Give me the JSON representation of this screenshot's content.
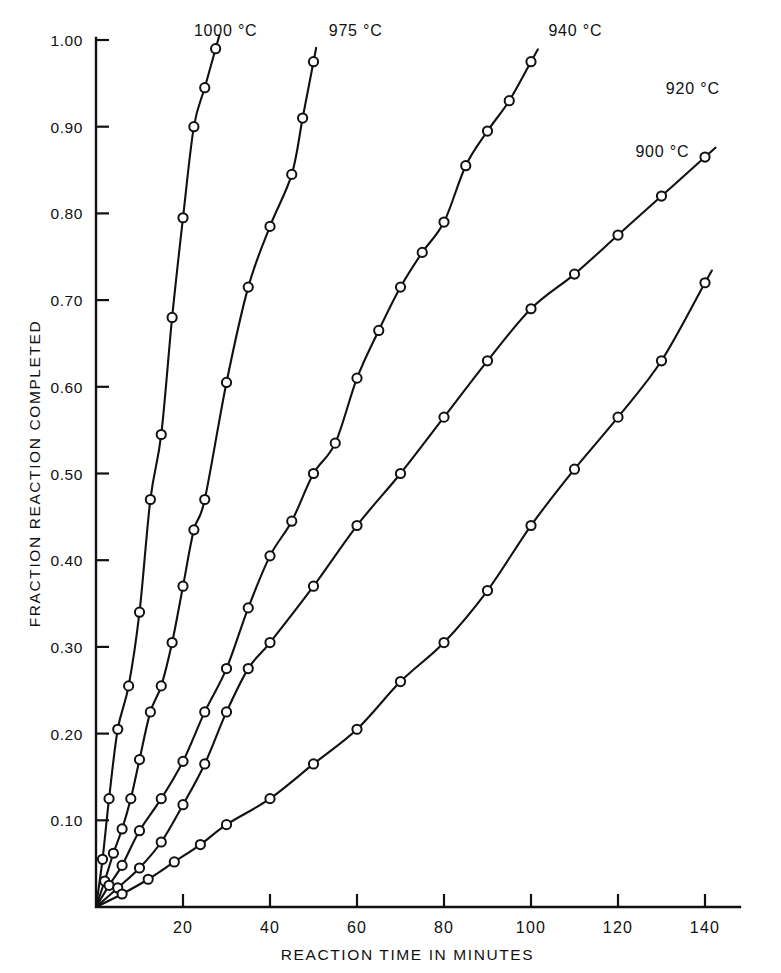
{
  "figure": {
    "background_color": "#ffffff",
    "ink_color": "#111111"
  },
  "chart_data": {
    "type": "line",
    "title": "",
    "subtitle": "",
    "xlabel": "REACTION TIME IN MINUTES",
    "ylabel": "FRACTION REACTION COMPLETED",
    "xlim": [
      0,
      145
    ],
    "ylim": [
      0,
      1.02
    ],
    "xticks": [
      0,
      20,
      40,
      60,
      80,
      100,
      120,
      140
    ],
    "xtick_labels": [
      "",
      "20",
      "40",
      "60",
      "80",
      "100",
      "120",
      "140"
    ],
    "yticks": [
      0.1,
      0.2,
      0.3,
      0.4,
      0.5,
      0.6,
      0.7,
      0.8,
      0.9,
      1.0
    ],
    "ytick_labels": [
      "0.10",
      "0.20",
      "0.30",
      "0.40",
      "0.50",
      "0.60",
      "0.70",
      "0.80",
      "0.90",
      "1.00"
    ],
    "grid": false,
    "legend_position": "inline-curve-labels",
    "marker_style": "open-circle",
    "line_color": "#111111",
    "series": [
      {
        "name": "1000 °C",
        "label": "1000 °C",
        "label_x": 22.5,
        "label_y": 1.005,
        "x": [
          0,
          1.5,
          3,
          5,
          7.5,
          10,
          12.5,
          15,
          17.5,
          20,
          22.5,
          25,
          27.5
        ],
        "y": [
          0.0,
          0.055,
          0.125,
          0.205,
          0.255,
          0.34,
          0.47,
          0.545,
          0.68,
          0.795,
          0.9,
          0.945,
          0.99
        ]
      },
      {
        "name": "975 °C",
        "label": "975 °C",
        "label_x": 53.5,
        "label_y": 1.005,
        "x": [
          0,
          2,
          4,
          6,
          8,
          10,
          12.5,
          15,
          17.5,
          20,
          22.5,
          25,
          30,
          35,
          40,
          45,
          47.5,
          50
        ],
        "y": [
          0.0,
          0.03,
          0.062,
          0.09,
          0.125,
          0.17,
          0.225,
          0.255,
          0.305,
          0.37,
          0.435,
          0.47,
          0.605,
          0.715,
          0.785,
          0.845,
          0.91,
          0.975
        ]
      },
      {
        "name": "940 °C",
        "label": "940 °C",
        "label_x": 104,
        "label_y": 1.005,
        "x": [
          0,
          3,
          6,
          10,
          15,
          20,
          25,
          30,
          35,
          40,
          45,
          50,
          55,
          60,
          65,
          70,
          75,
          80,
          85,
          90,
          95,
          100
        ],
        "y": [
          0.0,
          0.025,
          0.048,
          0.088,
          0.125,
          0.168,
          0.225,
          0.275,
          0.345,
          0.405,
          0.445,
          0.5,
          0.535,
          0.61,
          0.665,
          0.715,
          0.755,
          0.79,
          0.855,
          0.895,
          0.93,
          0.975
        ]
      },
      {
        "name": "920 °C",
        "label": "920 °C",
        "label_x": 131,
        "label_y": 0.938,
        "x": [
          0,
          5,
          10,
          15,
          20,
          25,
          30,
          35,
          40,
          50,
          60,
          70,
          80,
          90,
          100,
          110,
          120,
          130,
          140
        ],
        "y": [
          0.0,
          0.022,
          0.045,
          0.075,
          0.118,
          0.165,
          0.225,
          0.275,
          0.305,
          0.37,
          0.44,
          0.5,
          0.565,
          0.63,
          0.69,
          0.73,
          0.775,
          0.82,
          0.865
        ]
      },
      {
        "name": "900 °C",
        "label": "900 °C",
        "label_x": 124,
        "label_y": 0.865,
        "x": [
          0,
          6,
          12,
          18,
          24,
          30,
          40,
          50,
          60,
          70,
          80,
          90,
          100,
          110,
          120,
          130,
          140
        ],
        "y": [
          0.0,
          0.015,
          0.032,
          0.052,
          0.072,
          0.095,
          0.125,
          0.165,
          0.205,
          0.26,
          0.305,
          0.365,
          0.44,
          0.505,
          0.565,
          0.63,
          0.72
        ]
      }
    ]
  }
}
